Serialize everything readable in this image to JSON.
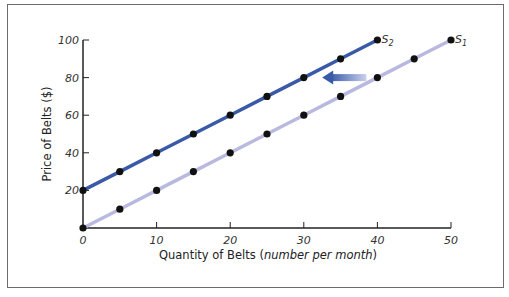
{
  "chart_data": {
    "type": "line",
    "title": "",
    "xlabel": "Quantity of Belts (number per month)",
    "xlabel_main": "Quantity of Belts (",
    "xlabel_italic": "number per month",
    "xlabel_close": ")",
    "ylabel": "Price of Belts ($)",
    "xlim": [
      0,
      50
    ],
    "ylim": [
      0,
      100
    ],
    "x_ticks": [
      0,
      10,
      20,
      30,
      40,
      50
    ],
    "y_ticks": [
      20,
      40,
      60,
      80,
      100
    ],
    "grid": false,
    "series": [
      {
        "name": "S1",
        "label_main": "S",
        "label_sub": "1",
        "color": "#b9b9e0",
        "x": [
          0,
          5,
          10,
          15,
          20,
          25,
          30,
          35,
          40,
          45,
          50
        ],
        "y": [
          0,
          10,
          20,
          30,
          40,
          50,
          60,
          70,
          80,
          90,
          100
        ]
      },
      {
        "name": "S2",
        "label_main": "S",
        "label_sub": "2",
        "color": "#3a5aa8",
        "x": [
          0,
          5,
          10,
          15,
          20,
          25,
          30,
          35,
          40
        ],
        "y": [
          20,
          30,
          40,
          50,
          60,
          70,
          80,
          90,
          100
        ]
      }
    ],
    "annotations": [
      {
        "type": "arrow",
        "direction": "left",
        "from": [
          38.5,
          80
        ],
        "to": [
          32.5,
          80
        ],
        "meaning": "supply shift from S1 to S2"
      }
    ]
  }
}
